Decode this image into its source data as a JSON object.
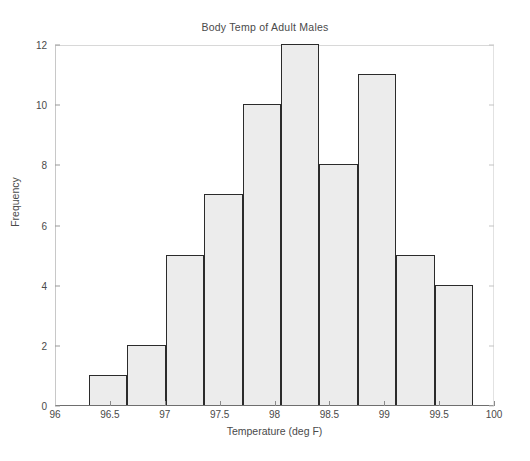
{
  "chart_data": {
    "type": "bar",
    "title": "Body Temp of Adult Males",
    "xlabel": "Temperature (deg F)",
    "ylabel": "Frequency",
    "xlim": [
      96,
      100
    ],
    "ylim": [
      0,
      12
    ],
    "grid": false,
    "legend": null,
    "bin_width": 0.35,
    "bin_edges": [
      96.3,
      96.65,
      97.0,
      97.35,
      97.7,
      98.05,
      98.4,
      98.75,
      99.1,
      99.45
    ],
    "categories": [
      "96.3-96.65",
      "96.65-97.0",
      "97.0-97.35",
      "97.35-97.7",
      "97.7-98.05",
      "98.05-98.4",
      "98.4-98.75",
      "98.75-99.1",
      "99.1-99.45",
      "99.45-99.45"
    ],
    "bin_centers": [
      96.475,
      96.825,
      97.175,
      97.525,
      97.875,
      98.225,
      98.575,
      98.925,
      99.275,
      99.45
    ],
    "values": [
      1,
      2,
      5,
      7,
      10,
      12,
      8,
      11,
      5,
      4
    ],
    "xticks": [
      "96",
      "96.5",
      "97",
      "97.5",
      "98",
      "98.5",
      "99",
      "99.5",
      "100"
    ],
    "xtick_values": [
      96,
      96.5,
      97,
      97.5,
      98,
      98.5,
      99,
      99.5,
      100
    ],
    "yticks": [
      "0",
      "2",
      "4",
      "6",
      "8",
      "10",
      "12"
    ],
    "ytick_values": [
      0,
      2,
      4,
      6,
      8,
      10,
      12
    ],
    "bar_fill_color": "#ececec",
    "bar_edge_color": "#2b2b2b",
    "axis_color": "#6e6e6e",
    "text_color": "#4a4a4a",
    "background_color": "#ffffff"
  }
}
